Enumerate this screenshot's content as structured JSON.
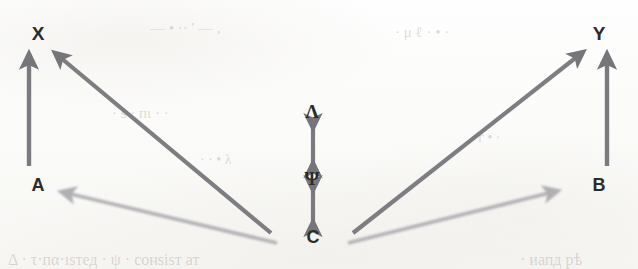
{
  "figure": {
    "type": "causal-path-diagram",
    "background_color": "#fdfdfc",
    "ink_color_dark": "#77777a",
    "ink_color_light": "#aeaeb2",
    "label_color": "#2b2b2b"
  },
  "nodes": [
    {
      "id": "X",
      "label": "X",
      "x": 38,
      "y": 33,
      "size": 19,
      "script": "latin"
    },
    {
      "id": "Y",
      "label": "Y",
      "x": 599,
      "y": 33,
      "size": 19,
      "script": "latin"
    },
    {
      "id": "A",
      "label": "A",
      "x": 38,
      "y": 185,
      "size": 18,
      "script": "latin"
    },
    {
      "id": "B",
      "label": "B",
      "x": 599,
      "y": 185,
      "size": 18,
      "script": "latin"
    },
    {
      "id": "C",
      "label": "C",
      "x": 313,
      "y": 237,
      "size": 18,
      "script": "latin"
    },
    {
      "id": "Psi",
      "label": "Ψ",
      "x": 312,
      "y": 178,
      "size": 19,
      "script": "greek"
    },
    {
      "id": "Lam",
      "label": "Λ",
      "x": 312,
      "y": 111,
      "size": 19,
      "script": "greek"
    }
  ],
  "edges": [
    {
      "id": "A-to-X",
      "from": "A",
      "to": "X",
      "style": "single-head",
      "weight": "dark",
      "orientation": "vertical-up"
    },
    {
      "id": "B-to-Y",
      "from": "B",
      "to": "Y",
      "style": "single-head",
      "weight": "dark",
      "orientation": "vertical-up"
    },
    {
      "id": "C-to-X",
      "from": "C",
      "to": "X",
      "style": "single-head",
      "weight": "dark",
      "orientation": "diagonal-up-left"
    },
    {
      "id": "C-to-Y",
      "from": "C",
      "to": "Y",
      "style": "single-head",
      "weight": "dark",
      "orientation": "diagonal-up-right"
    },
    {
      "id": "C-to-A",
      "from": "C",
      "to": "A",
      "style": "single-head",
      "weight": "light",
      "orientation": "diagonal-up-left"
    },
    {
      "id": "C-to-B",
      "from": "C",
      "to": "B",
      "style": "single-head",
      "weight": "light",
      "orientation": "diagonal-up-right"
    },
    {
      "id": "C-to-Psi",
      "from": "C",
      "to": "Psi",
      "style": "double-head",
      "weight": "dark",
      "orientation": "vertical"
    },
    {
      "id": "Psi-to-Lambda",
      "from": "Psi",
      "to": "Lam",
      "style": "double-head",
      "weight": "dark",
      "orientation": "vertical"
    }
  ],
  "bleed_through": [
    {
      "text": "—  •   ··   ' — ,",
      "x": 150,
      "y": 20,
      "size": 15,
      "rotate": 0
    },
    {
      "text": "· μ   ℓ · • ·",
      "x": 395,
      "y": 24,
      "size": 15,
      "rotate": 0
    },
    {
      "text": "· ѕ ·  пι · ·",
      "x": 112,
      "y": 105,
      "size": 15,
      "rotate": 0
    },
    {
      "text": "· · •   λ",
      "x": 200,
      "y": 152,
      "size": 14,
      "rotate": 0
    },
    {
      "text": "Δ ·  τ·пα·ıѕтед ·  ψ   · сонѕіѕт ат",
      "x": 8,
      "y": 251,
      "size": 16,
      "rotate": 0
    },
    {
      "text": "· иапд рѣ",
      "x": 520,
      "y": 251,
      "size": 16,
      "rotate": 0
    },
    {
      "text": "· г • ·",
      "x": 470,
      "y": 130,
      "size": 14,
      "rotate": 0
    }
  ]
}
